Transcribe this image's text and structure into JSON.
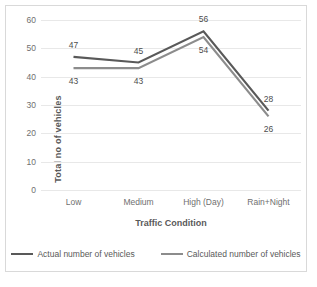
{
  "chart_data": {
    "type": "line",
    "title": "",
    "xlabel": "Traffic Condition",
    "ylabel": "Total no of vehicles",
    "categories": [
      "Low",
      "Medium",
      "High (Day)",
      "Rain+Night"
    ],
    "series": [
      {
        "name": "Actual number of vehicles",
        "values": [
          47,
          45,
          56,
          28
        ],
        "color": "#595959",
        "label_position": "above"
      },
      {
        "name": "Calculated number of vehicles",
        "values": [
          43,
          43,
          54,
          26
        ],
        "color": "#8c8c8c",
        "label_position": "below"
      }
    ],
    "ylim": [
      0,
      60
    ],
    "yticks": [
      0,
      10,
      20,
      30,
      40,
      50,
      60
    ],
    "ytick_labels": [
      "0",
      "10",
      "20",
      "30",
      "40",
      "50",
      "60"
    ],
    "grid": true,
    "legend_position": "bottom",
    "data_labels": [
      {
        "text": "47",
        "series": 0,
        "index": 0
      },
      {
        "text": "45",
        "series": 0,
        "index": 1
      },
      {
        "text": "56",
        "series": 0,
        "index": 2
      },
      {
        "text": "28",
        "series": 0,
        "index": 3
      },
      {
        "text": "43",
        "series": 1,
        "index": 0
      },
      {
        "text": "43",
        "series": 1,
        "index": 1
      },
      {
        "text": "54",
        "series": 1,
        "index": 2
      },
      {
        "text": "26",
        "series": 1,
        "index": 3
      }
    ]
  }
}
